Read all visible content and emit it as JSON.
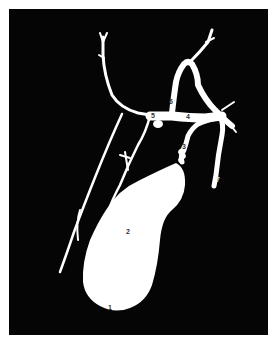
{
  "figure": {
    "title": "",
    "colors": {
      "background": "#050505",
      "structure": "#ffffff",
      "frame": "#ffffff"
    },
    "labels": [
      {
        "id": "1",
        "text": "1",
        "structure": "gallbladder-fundus"
      },
      {
        "id": "2",
        "text": "2",
        "structure": "gallbladder-body"
      },
      {
        "id": "3",
        "text": "3",
        "structure": "cystic-duct"
      },
      {
        "id": "4",
        "text": "4",
        "structure": "common-hepatic-duct"
      },
      {
        "id": "5",
        "text": "5",
        "structure": "right-hepatic-duct"
      },
      {
        "id": "6",
        "text": "6",
        "structure": "left-hepatic-duct"
      },
      {
        "id": "7",
        "text": "7",
        "structure": "common-bile-duct"
      }
    ]
  }
}
